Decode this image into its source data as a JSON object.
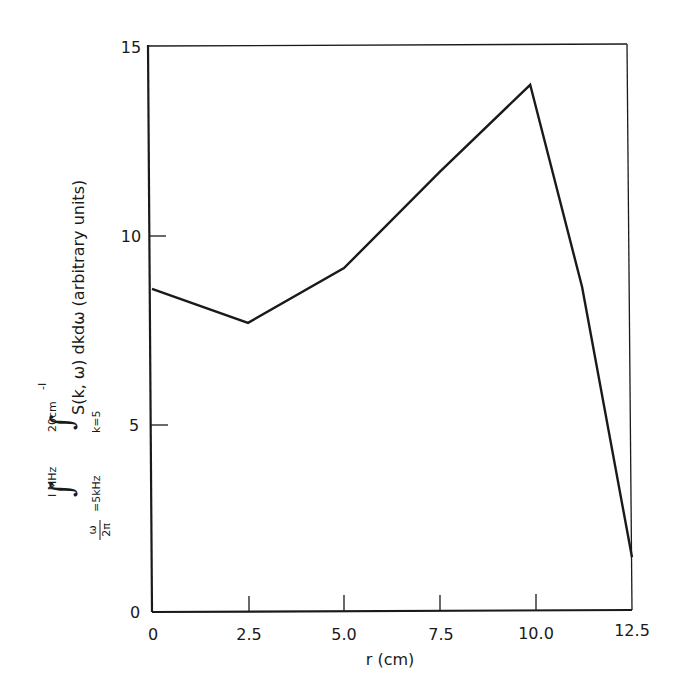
{
  "chart_data": {
    "type": "line",
    "title": "",
    "xlabel": "r (cm)",
    "ylabel": "∫ from ω/2π=5kHz to 1 MHz ∫ from k=5 to 20cm⁻¹ S(k, ω) dkdω (arbitrary units)",
    "ylabel_parts": {
      "outer_integral_upper": "1 MHz",
      "outer_integral_lower": "ω/2π =5kHz",
      "inner_integral_upper": "20cm⁻¹",
      "inner_integral_lower": "k=5",
      "integrand": "S(k, ω) dkdω",
      "units": "(arbitrary units)"
    },
    "xlim": [
      0,
      12.5
    ],
    "ylim": [
      0,
      15
    ],
    "x_ticks": [
      "0",
      "2.5",
      "5.0",
      "7.5",
      "10.0",
      "12.5"
    ],
    "x_tick_values": [
      0,
      2.5,
      5.0,
      7.5,
      10.0,
      12.5
    ],
    "y_ticks": [
      "0",
      "5",
      "10",
      "15"
    ],
    "y_tick_values": [
      0,
      5,
      10,
      15
    ],
    "grid": false,
    "legend": null,
    "series": [
      {
        "name": "spectral integral",
        "x": [
          0,
          2.5,
          5.0,
          7.5,
          9.85,
          11.2,
          12.5
        ],
        "y": [
          8.6,
          7.7,
          9.15,
          11.7,
          14.0,
          8.65,
          1.5
        ]
      }
    ]
  },
  "labels": {
    "x_axis": "r (cm)",
    "y_outer_upper": "I MHz",
    "y_outer_lower_frac_num": "ω",
    "y_outer_lower_frac_den": "2π",
    "y_outer_lower_rest": "=5kHz",
    "y_inner_upper": "20cm",
    "y_inner_upper_sup": "-I",
    "y_inner_lower": "k=5",
    "y_integrand": "S(k, ω) dkdω  (arbitrary units)",
    "integral_sign": "∫"
  }
}
